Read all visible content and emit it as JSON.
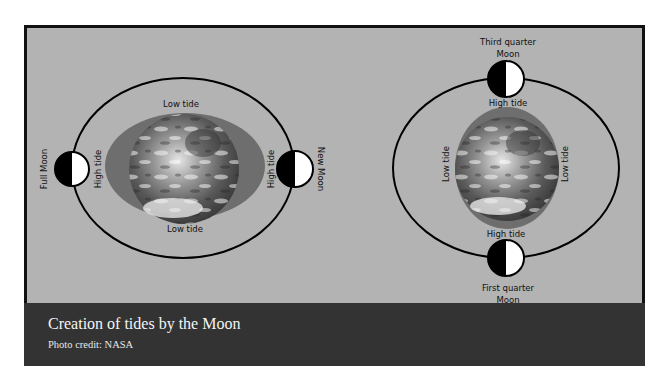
{
  "figure": {
    "caption": {
      "title": "Creation of tides by the Moon",
      "credit": "Photo credit: NASA"
    },
    "colors": {
      "background": "#b3b3b3",
      "water_bulge": "#6e6e6e",
      "orbit": "#000000",
      "moon_dark": "#000000",
      "moon_light": "#ffffff",
      "caption_bg": "#333333",
      "caption_text": "#f5f5f5"
    },
    "left_diagram": {
      "name": "spring-tide",
      "moons": {
        "left": "Full Moon",
        "right": "New Moon"
      },
      "tide_labels": {
        "top": "Low tide",
        "bottom": "Low tide",
        "left": "High tide",
        "right": "High tide"
      }
    },
    "right_diagram": {
      "name": "neap-tide",
      "moons": {
        "top_line1": "Third quarter",
        "top_line2": "Moon",
        "bottom_line1": "First quarter",
        "bottom_line2": "Moon"
      },
      "tide_labels": {
        "top": "High tide",
        "bottom": "High tide",
        "left": "Low tide",
        "right": "Low tide"
      }
    }
  }
}
